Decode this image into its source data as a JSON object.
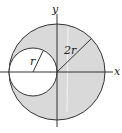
{
  "diagram": {
    "type": "geometry",
    "labels": {
      "y_axis": "y",
      "x_axis": "x",
      "big_radius": "2r",
      "small_radius": "r"
    },
    "colors": {
      "shaded_region": "#d9d9d9",
      "stroke": "#333333",
      "small_circle_fill": "#ffffff",
      "background": "#ffffff"
    },
    "shapes": {
      "big_circle": {
        "cx": 57,
        "cy": 72,
        "r": 48
      },
      "small_circle": {
        "cx": 33,
        "cy": 72,
        "r": 24
      }
    }
  }
}
